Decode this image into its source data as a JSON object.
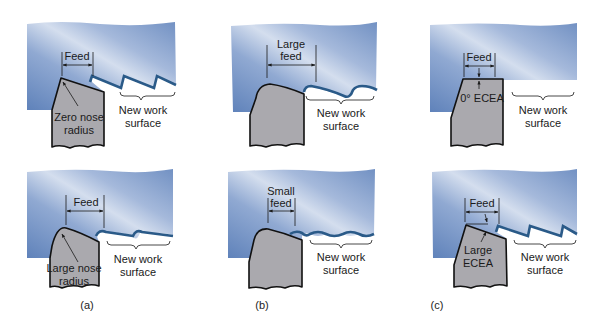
{
  "figure": {
    "colors": {
      "workpiece_dark": "#6a8cc0",
      "workpiece_light": "#d4deee",
      "tool_fill": "#aaa9ae",
      "tool_outline": "#111111",
      "cut_surface": "#2a5a88"
    },
    "panels": [
      {
        "id": "a",
        "caption": "(a)",
        "top": {
          "feed_label": "Feed",
          "tool_label_line1": "Zero nose",
          "tool_label_line2": "radius",
          "surface_label_line1": "New work",
          "surface_label_line2": "surface"
        },
        "bottom": {
          "feed_label": "Feed",
          "tool_label_line1": "Large nose",
          "tool_label_line2": "radius",
          "surface_label_line1": "New work",
          "surface_label_line2": "surface"
        }
      },
      {
        "id": "b",
        "caption": "(b)",
        "top": {
          "feed_label_line1": "Large",
          "feed_label_line2": "feed",
          "surface_label_line1": "New work",
          "surface_label_line2": "surface"
        },
        "bottom": {
          "feed_label_line1": "Small",
          "feed_label_line2": "feed",
          "surface_label_line1": "New work",
          "surface_label_line2": "surface"
        }
      },
      {
        "id": "c",
        "caption": "(c)",
        "top": {
          "feed_label": "Feed",
          "tool_label": "0° ECEA",
          "surface_label_line1": "New work",
          "surface_label_line2": "surface"
        },
        "bottom": {
          "feed_label": "Feed",
          "tool_label_line1": "Large",
          "tool_label_line2": "ECEA",
          "surface_label_line1": "New work",
          "surface_label_line2": "surface"
        }
      }
    ]
  }
}
